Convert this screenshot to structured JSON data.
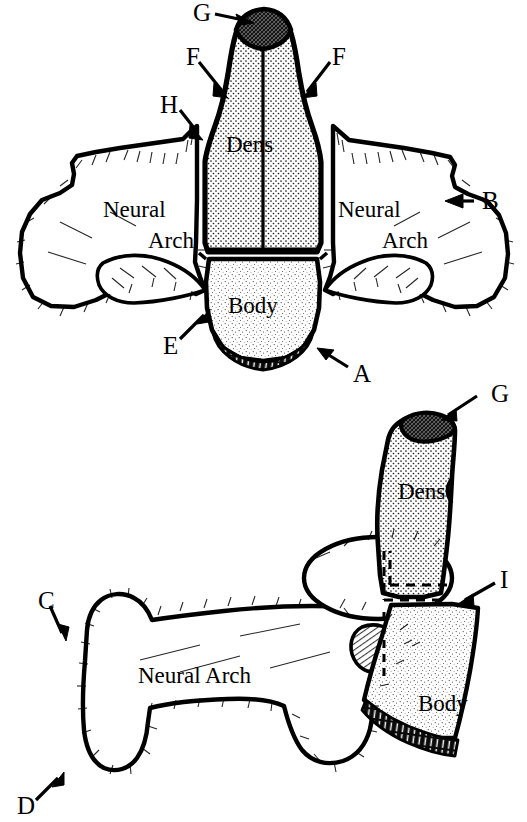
{
  "figure": {
    "background_color": "#ffffff",
    "ink_color": "#000000",
    "views": [
      {
        "name": "superior-view",
        "position": "top",
        "part_labels": [
          "Dens",
          "Neural Arch",
          "Neural Arch",
          "Body"
        ],
        "letter_labels": [
          "G",
          "F",
          "F",
          "H",
          "B",
          "E",
          "A"
        ]
      },
      {
        "name": "lateral-view",
        "position": "bottom",
        "part_labels": [
          "Dens",
          "Neural Arch",
          "Body"
        ],
        "letter_labels": [
          "G",
          "I",
          "C",
          "D"
        ]
      }
    ]
  },
  "top_view": {
    "dens_label": "Dens",
    "left_arch_line1": "Neural",
    "left_arch_line2": "Arch",
    "right_arch_line1": "Neural",
    "right_arch_line2": "Arch",
    "body_label": "Body",
    "letters": {
      "g": "G",
      "f_left": "F",
      "f_right": "F",
      "h": "H",
      "b": "B",
      "e": "E",
      "a": "A"
    }
  },
  "bottom_view": {
    "dens_label": "Dens",
    "neural_arch_label": "Neural Arch",
    "body_label": "Body",
    "letters": {
      "g": "G",
      "i": "I",
      "c": "C",
      "d": "D"
    }
  },
  "colors": {
    "ink": "#000000",
    "paper": "#ffffff",
    "stipple": "#3a3a3a",
    "apex_fill": "#1a1a1a"
  }
}
